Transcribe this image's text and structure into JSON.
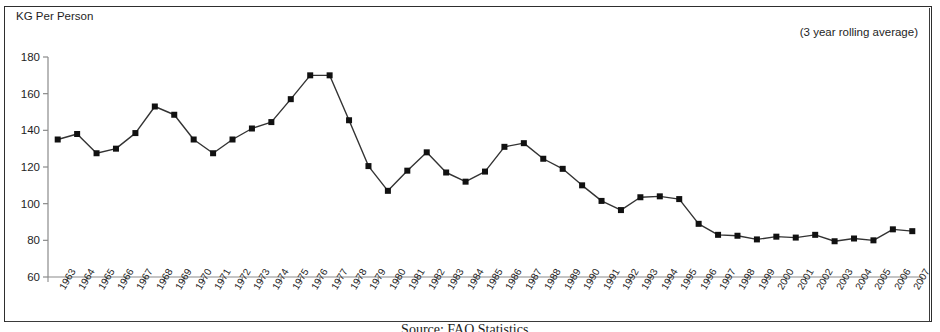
{
  "figure": {
    "yaxis_title": "KG Per Person",
    "annotation": "(3 year rolling average)",
    "caption": "Source: FAO Statistics..."
  },
  "chart_data": {
    "type": "line",
    "title": "",
    "subtitle": "",
    "annotation": "(3 year rolling average)",
    "xlabel": "",
    "ylabel": "KG Per Person",
    "ylim": [
      60,
      180
    ],
    "ytick_values": [
      60,
      80,
      100,
      120,
      140,
      160,
      180
    ],
    "grid": false,
    "legend_position": "none",
    "marker": "square",
    "marker_color": "#111111",
    "line_color": "#333333",
    "categories": [
      "1963",
      "1964",
      "1965",
      "1966",
      "1967",
      "1968",
      "1969",
      "1970",
      "1971",
      "1972",
      "1973",
      "1974",
      "1975",
      "1976",
      "1977",
      "1978",
      "1979",
      "1980",
      "1981",
      "1982",
      "1983",
      "1984",
      "1985",
      "1986",
      "1987",
      "1988",
      "1989",
      "1990",
      "1991",
      "1992",
      "1993",
      "1994",
      "1995",
      "1996",
      "1997",
      "1998",
      "1999",
      "2000",
      "2001",
      "2002",
      "2003",
      "2004",
      "2005",
      "2006",
      "2007"
    ],
    "values": [
      135,
      138,
      127.5,
      130,
      138.5,
      153,
      148.5,
      135,
      127.5,
      135,
      141,
      144.5,
      157,
      170,
      170,
      145.5,
      120.5,
      107,
      118,
      128,
      117,
      112,
      117.5,
      131,
      133,
      124.5,
      119,
      110,
      101.5,
      96.5,
      103.5,
      104,
      102.5,
      89,
      83,
      82.5,
      80.5,
      82,
      81.5,
      83,
      79.5,
      81,
      80,
      86,
      85
    ]
  }
}
